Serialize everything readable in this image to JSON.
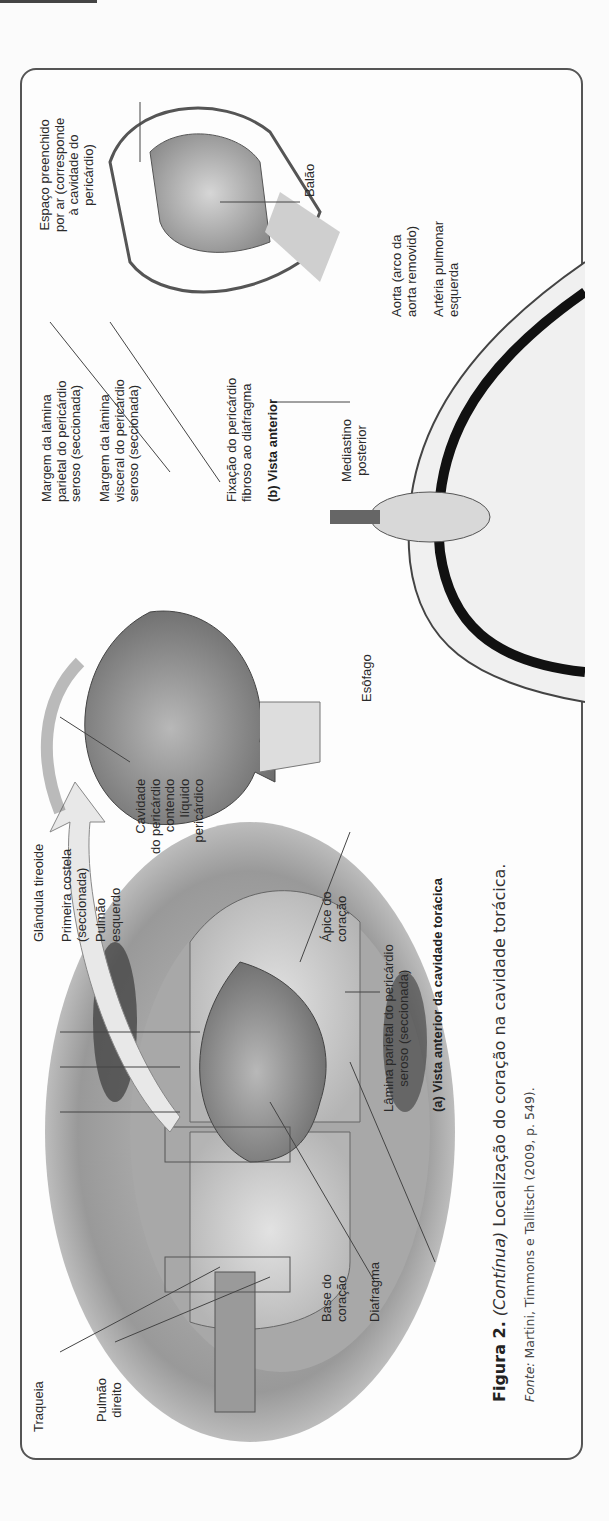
{
  "figure": {
    "number_label": "Figura 2.",
    "continued_label": "(Contínua)",
    "caption_text": "Localização do coração na cavidade torácica.",
    "source_label": "Fonte:",
    "source_text": "Martini, Timmons e Tallitsch (2009, p. 549).",
    "panel_a": {
      "title": "(a) Vista anterior da cavidade torácica",
      "labels": {
        "traqueia": "Traqueia",
        "pulmao_direito_1": "Pulmão",
        "pulmao_direito_2": "direito",
        "glandula_tireoide": "Glândula tireoide",
        "primeira_costela_1": "Primeira costela",
        "primeira_costela_2": "(seccionada)",
        "pulmao_esquerdo_1": "Pulmão",
        "pulmao_esquerdo_2": "esquerdo",
        "apice_1": "Ápice do",
        "apice_2": "coração",
        "lamina_1": "Lâmina parietal do pericárdio",
        "lamina_2": "seroso (seccionada)",
        "base_1": "Base do",
        "base_2": "coração",
        "diafragma": "Diafragma"
      }
    },
    "panel_b": {
      "title": "(b) Vista anterior",
      "labels": {
        "cavidade_1": "Cavidade",
        "cavidade_2": "do pericárdio",
        "cavidade_3": "contendo",
        "cavidade_4": "líquido",
        "cavidade_5": "pericárdico",
        "margem_parietal_1": "Margem da lâmina",
        "margem_parietal_2": "parietal do pericárdio",
        "margem_parietal_3": "seroso (seccionada)",
        "margem_visceral_1": "Margem da lâmina",
        "margem_visceral_2": "visceral do pericárdio",
        "margem_visceral_3": "seroso (seccionada)",
        "fixacao_1": "Fixação do pericárdio",
        "fixacao_2": "fibroso ao diafragma"
      }
    },
    "panel_c": {
      "labels": {
        "esofago": "Esôfago",
        "mediastino_1": "Mediastino",
        "mediastino_2": "posterior",
        "aorta_1": "Aorta (arco da",
        "aorta_2": "aorta removido)",
        "arteria_1": "Artéria pulmonar",
        "arteria_2": "esquerda"
      }
    },
    "balloon_model": {
      "labels": {
        "espaco_1": "Espaço preenchido",
        "espaco_2": "por ar (corresponde",
        "espaco_3": "à cavidade do",
        "espaco_4": "pericárdio)",
        "balao": "Balão"
      }
    }
  }
}
